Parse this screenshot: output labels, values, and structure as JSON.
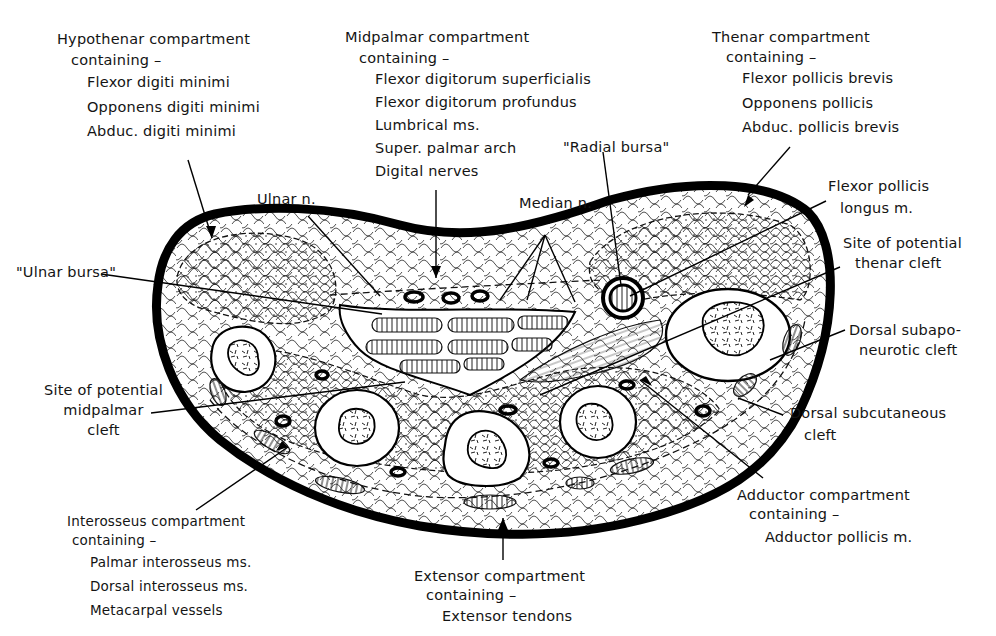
{
  "figure": {
    "colors": {
      "ink": "#111111",
      "background": "#ffffff"
    }
  },
  "labels": {
    "hypothenar": {
      "heading": "Hypothenar compartment",
      "sub": "containing –",
      "items": [
        "Flexor digiti minimi",
        "Opponens digiti minimi",
        "Abduc. digiti minimi"
      ]
    },
    "midpalmar": {
      "heading": "Midpalmar compartment",
      "sub": "containing –",
      "items": [
        "Flexor digitorum superficialis",
        "Flexor digitorum profundus",
        "Lumbrical ms.",
        "Super. palmar arch",
        "Digital nerves"
      ]
    },
    "thenar": {
      "heading": "Thenar compartment",
      "sub": "containing –",
      "items": [
        "Flexor pollicis brevis",
        "Opponens pollicis",
        "Abduc. pollicis brevis"
      ]
    },
    "radial_bursa": "\"Radial bursa\"",
    "ulnar_n": "Ulnar n.",
    "median_n": "Median n.",
    "flexor_pollicis_longus": [
      "Flexor pollicis",
      "longus m."
    ],
    "ulnar_bursa": "\"Ulnar bursa\"",
    "thenar_cleft": [
      "Site of potential",
      "thenar cleft"
    ],
    "dorsal_subaponeurotic": [
      "Dorsal subapo-",
      "neurotic cleft"
    ],
    "midpalmar_cleft": [
      "Site of potential",
      "midpalmar",
      "cleft"
    ],
    "dorsal_subcutaneous": [
      "Dorsal subcutaneous",
      "cleft"
    ],
    "interosseus": {
      "heading": "Interosseus compartment",
      "sub": "containing –",
      "items": [
        "Palmar interosseus ms.",
        "Dorsal interosseus ms.",
        "Metacarpal vessels"
      ]
    },
    "extensor": {
      "heading": "Extensor compartment",
      "sub": "containing –",
      "items": [
        "Extensor tendons"
      ]
    },
    "adductor": {
      "heading": "Adductor compartment",
      "sub": "containing –",
      "items": [
        "Adductor pollicis m."
      ]
    }
  }
}
